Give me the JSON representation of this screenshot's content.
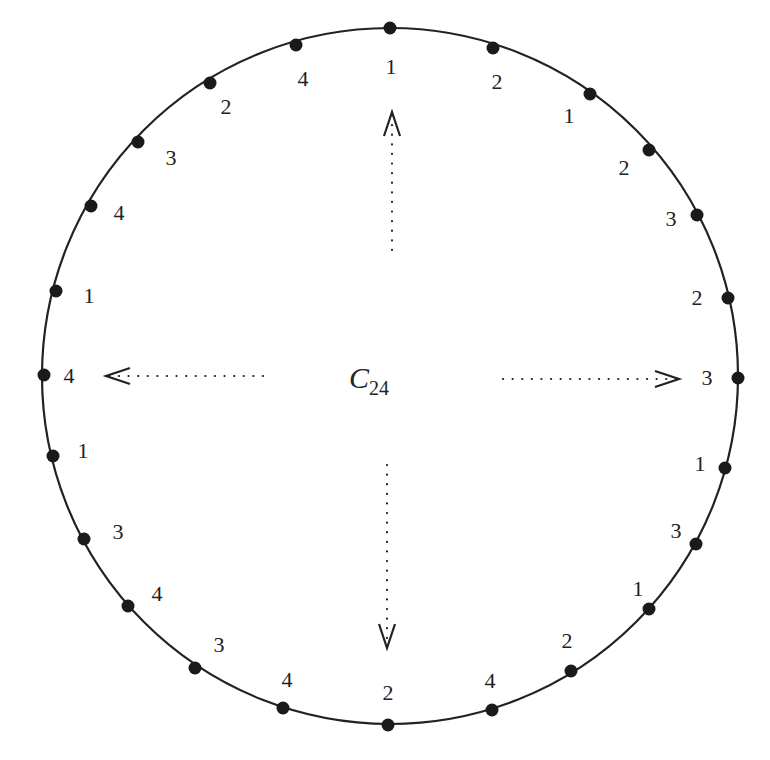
{
  "diagram": {
    "title": "C24",
    "title_main": "C",
    "title_sub": "24",
    "colors": {
      "stroke": "#222222",
      "dot": "#1a1a1a",
      "background": "#ffffff"
    },
    "circle": {
      "cx": 390,
      "cy": 376,
      "r": 348
    },
    "vertices": [
      {
        "label": "1",
        "x": 390,
        "y": 28,
        "lx": 391,
        "ly": 67
      },
      {
        "label": "2",
        "x": 493,
        "y": 48,
        "lx": 497,
        "ly": 82
      },
      {
        "label": "1",
        "x": 590,
        "y": 94,
        "lx": 569,
        "ly": 116
      },
      {
        "label": "2",
        "x": 649,
        "y": 150,
        "lx": 624,
        "ly": 168
      },
      {
        "label": "3",
        "x": 697,
        "y": 215,
        "lx": 671,
        "ly": 219
      },
      {
        "label": "2",
        "x": 728,
        "y": 298,
        "lx": 697,
        "ly": 298
      },
      {
        "label": "3",
        "x": 738,
        "y": 378,
        "lx": 707,
        "ly": 378
      },
      {
        "label": "1",
        "x": 725,
        "y": 468,
        "lx": 700,
        "ly": 464
      },
      {
        "label": "3",
        "x": 696,
        "y": 544,
        "lx": 676,
        "ly": 531
      },
      {
        "label": "1",
        "x": 649,
        "y": 609,
        "lx": 638,
        "ly": 589
      },
      {
        "label": "2",
        "x": 571,
        "y": 671,
        "lx": 567,
        "ly": 641
      },
      {
        "label": "4",
        "x": 492,
        "y": 710,
        "lx": 490,
        "ly": 681
      },
      {
        "label": "2",
        "x": 388,
        "y": 725,
        "lx": 388,
        "ly": 693
      },
      {
        "label": "4",
        "x": 283,
        "y": 708,
        "lx": 287,
        "ly": 680
      },
      {
        "label": "3",
        "x": 195,
        "y": 668,
        "lx": 219,
        "ly": 645
      },
      {
        "label": "4",
        "x": 128,
        "y": 606,
        "lx": 157,
        "ly": 594
      },
      {
        "label": "3",
        "x": 84,
        "y": 539,
        "lx": 118,
        "ly": 532
      },
      {
        "label": "1",
        "x": 53,
        "y": 456,
        "lx": 83,
        "ly": 451
      },
      {
        "label": "4",
        "x": 44,
        "y": 375,
        "lx": 69,
        "ly": 376
      },
      {
        "label": "1",
        "x": 56,
        "y": 291,
        "lx": 89,
        "ly": 296
      },
      {
        "label": "4",
        "x": 91,
        "y": 206,
        "lx": 119,
        "ly": 213
      },
      {
        "label": "3",
        "x": 138,
        "y": 142,
        "lx": 171,
        "ly": 158
      },
      {
        "label": "2",
        "x": 210,
        "y": 83,
        "lx": 226,
        "ly": 107
      },
      {
        "label": "4",
        "x": 296,
        "y": 45,
        "lx": 303,
        "ly": 79
      }
    ],
    "arrows": [
      {
        "name": "arrow-up",
        "x1": 392,
        "y1": 250,
        "x2": 392,
        "y2": 112
      },
      {
        "name": "arrow-right",
        "x1": 503,
        "y1": 379,
        "x2": 679,
        "y2": 379
      },
      {
        "name": "arrow-down",
        "x1": 387,
        "y1": 465,
        "x2": 387,
        "y2": 648
      },
      {
        "name": "arrow-left",
        "x1": 263,
        "y1": 376,
        "x2": 106,
        "y2": 376
      }
    ]
  }
}
